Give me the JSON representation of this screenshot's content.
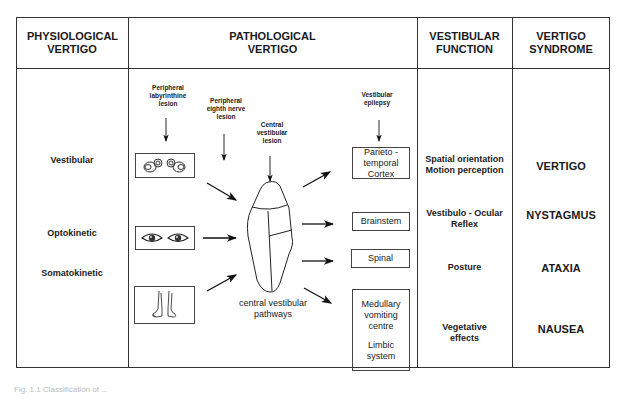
{
  "headers": {
    "physiological": "PHYSIOLOGICAL VERTIGO",
    "pathological": "PATHOLOGICAL VERTIGO",
    "function": "VESTIBULAR FUNCTION",
    "syndrome": "VERTIGO SYNDROME"
  },
  "physiological_types": [
    "Vestibular",
    "Optokinetic",
    "Somatokinetic"
  ],
  "lesions": {
    "labyrinthine": "Peripheral labyrinthine lesion",
    "eighth_nerve": "Peripheral eighth nerve lesion",
    "central": "Central vestibular lesion",
    "epilepsy": "Vestibular epilepsy"
  },
  "input_images": [
    "labyrinth-image",
    "eyes-image",
    "feet-image"
  ],
  "center_label": "central vestibular pathways",
  "targets": [
    "Parieto - temporal Cortex",
    "Brainstem",
    "Spinal",
    "Medullary vomiting centre",
    "Limbic system"
  ],
  "functions": [
    "Spatial orientation Motion perception",
    "Vestibulo - Ocular Reflex",
    "Posture",
    "Vegetative effects"
  ],
  "syndromes": [
    "VERTIGO",
    "NYSTAGMUS",
    "ATAXIA",
    "NAUSEA"
  ],
  "caption": "Fig. 1.1 Classification of ..."
}
